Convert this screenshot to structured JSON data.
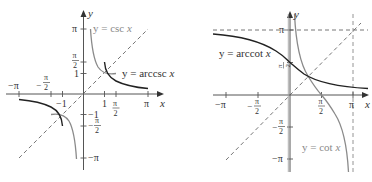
{
  "figure": {
    "panels": [
      {
        "id": "left",
        "axis_labels": {
          "x": "x",
          "y": "y"
        },
        "x_ticks": [
          "−π",
          "−π/2",
          "−1",
          "1",
          "π/2",
          "π"
        ],
        "y_ticks": [
          "π",
          "π/2",
          "1",
          "−1",
          "−π/2",
          "−π"
        ],
        "curves": [
          {
            "name": "csc",
            "label": "y = csc x",
            "color": "#8a8a8a"
          },
          {
            "name": "arccsc",
            "label": "y = arccsc x",
            "color": "#222222"
          }
        ],
        "reference_line": "y = x (dashed)"
      },
      {
        "id": "right",
        "axis_labels": {
          "x": "x",
          "y": "y"
        },
        "x_ticks": [
          "−π",
          "−π/2",
          "π/2",
          "π"
        ],
        "y_ticks": [
          "π",
          "π/2",
          "−π/2",
          "−π"
        ],
        "curves": [
          {
            "name": "arccot",
            "label": "y = arccot x",
            "color": "#222222"
          },
          {
            "name": "cot",
            "label": "y = cot x",
            "color": "#8a8a8a"
          }
        ],
        "reference_line": "y = x (dashed)",
        "asymptotes": [
          "y = π (dashed)",
          "x = π (dashed)"
        ]
      }
    ],
    "text": {
      "y": "y",
      "x": "x",
      "pi": "π",
      "neg_pi": "−π",
      "one": "1",
      "neg_one": "−1",
      "pi_num": "π",
      "two": "2",
      "minus": "−",
      "csc_label": "y = csc x",
      "arccsc_label_y": "y = arccsc ",
      "arccsc_label_x": "x",
      "arccot_label_y": "y = arccot ",
      "arccot_label_x": "x",
      "cot_label_y": "y = cot ",
      "cot_label_x": "x",
      "csc_label_y": "y = csc ",
      "csc_label_x": "x"
    }
  }
}
